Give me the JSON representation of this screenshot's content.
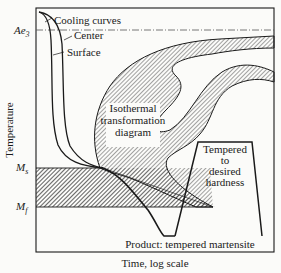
{
  "diagram": {
    "y_axis_label": "Temperature",
    "x_axis_label": "Time, log scale",
    "temperature_levels": {
      "ae3": {
        "base": "Ae",
        "sub": "3"
      },
      "ms": {
        "base": "M",
        "sub": "s"
      },
      "mf": {
        "base": "M",
        "sub": "f"
      }
    },
    "labels": {
      "cooling_curves": "Cooling curves",
      "center": "Center",
      "surface": "Surface",
      "ittd_line1": "Isothermal",
      "ittd_line2": "transformation",
      "ittd_line3": "diagram",
      "tempered_line1": "Tempered",
      "tempered_line2": "to",
      "tempered_line3": "desired",
      "tempered_line4": "hardness",
      "product": "Product: tempered martensite"
    },
    "colors": {
      "line": "#1a1a1a",
      "background": "#fbfbf9"
    }
  }
}
